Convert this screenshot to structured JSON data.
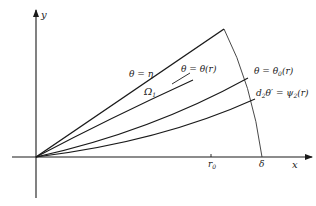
{
  "diagram": {
    "axes": {
      "x_label": "x",
      "y_label": "y",
      "x_ticks": [
        {
          "label": "r₀",
          "sub": "0",
          "base": "r",
          "x": 211
        },
        {
          "label": "δ",
          "x": 262
        }
      ]
    },
    "curves": [
      {
        "id": "theta-eta",
        "label": "θ = η"
      },
      {
        "id": "theta-r",
        "label": "θ = θ(r)"
      },
      {
        "id": "theta0-r",
        "label": "θ = θ₀(r)",
        "base": "θ = θ",
        "sub": "0",
        "tail": "(r)"
      },
      {
        "id": "psi2",
        "label": "d₂θ′ = ψ₂(r)",
        "d": "d",
        "d_sub": "2",
        "mid": "θ′ = ψ",
        "psi_sub": "2",
        "tail": "(r)"
      }
    ],
    "region_label": {
      "base": "Ω",
      "sub": "1"
    },
    "colors": {
      "ink": "#1a1a1a",
      "arc": "#333333",
      "background": "#ffffff"
    }
  }
}
